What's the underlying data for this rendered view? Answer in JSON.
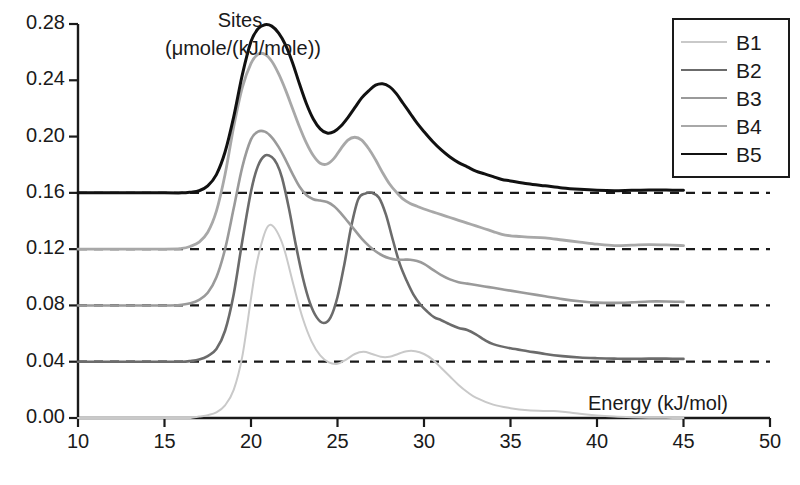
{
  "chart_data": {
    "type": "line",
    "title": "",
    "xlabel": "Energy (kJ/mol)",
    "ylabel": "Sites",
    "ylabel_units": "(μmole/(kJ/mole))",
    "xlim": [
      10,
      50
    ],
    "ylim": [
      0.0,
      0.28
    ],
    "xticks": [
      10,
      15,
      20,
      25,
      30,
      35,
      40,
      45,
      50
    ],
    "xtick_labels": [
      "10",
      "15",
      "20",
      "25",
      "30",
      "35",
      "40",
      "45",
      "50"
    ],
    "yticks": [
      0.0,
      0.04,
      0.08,
      0.12,
      0.16,
      0.2,
      0.24,
      0.28
    ],
    "ytick_labels": [
      "0.00",
      "0.04",
      "0.08",
      "0.12",
      "0.16",
      "0.20",
      "0.24",
      "0.28"
    ],
    "grid": false,
    "baseline_style": "dashed",
    "legend_position": "top-right",
    "note": "Site energy distribution curves, each vertically offset onto its own dashed baseline",
    "series": [
      {
        "name": "B1",
        "color": "#c9c9c9",
        "width": 2.0,
        "baseline": 0.0,
        "x": [
          10,
          15,
          16,
          16.5,
          17,
          17.5,
          18,
          18.5,
          19,
          19.5,
          20,
          20.3,
          20.7,
          21,
          21.3,
          21.7,
          22,
          22.5,
          23,
          23.5,
          24,
          24.5,
          25,
          25.5,
          26,
          26.5,
          27,
          27.5,
          28,
          28.5,
          29,
          29.5,
          30,
          30.5,
          31,
          31.5,
          32,
          32.5,
          33,
          34,
          35,
          36,
          37,
          37.5,
          38,
          39,
          40,
          41,
          42,
          43,
          44,
          45
        ],
        "y": [
          0.0,
          0.0,
          0.0,
          0.0,
          0.001,
          0.002,
          0.004,
          0.009,
          0.02,
          0.044,
          0.085,
          0.108,
          0.128,
          0.1365,
          0.136,
          0.1275,
          0.1165,
          0.0925,
          0.0705,
          0.0545,
          0.0445,
          0.0395,
          0.0385,
          0.0415,
          0.0455,
          0.047,
          0.0455,
          0.0435,
          0.0435,
          0.0455,
          0.0475,
          0.0475,
          0.0455,
          0.0415,
          0.0355,
          0.0295,
          0.0235,
          0.0185,
          0.0145,
          0.0095,
          0.007,
          0.0055,
          0.005,
          0.005,
          0.0045,
          0.003,
          0.0018,
          0.001,
          0.0005,
          0.0002,
          0.0001,
          0.0
        ]
      },
      {
        "name": "B2",
        "color": "#6b6b6b",
        "width": 2.6,
        "baseline": 0.04,
        "x": [
          10,
          15,
          16,
          16.5,
          17,
          17.5,
          18,
          18.5,
          19,
          19.5,
          20,
          20.4,
          20.8,
          21.2,
          21.5,
          21.8,
          22.2,
          22.6,
          23,
          23.4,
          23.8,
          24.2,
          24.6,
          25,
          25.4,
          25.8,
          26.2,
          26.6,
          27,
          27.4,
          27.8,
          28.2,
          28.6,
          29,
          29.4,
          29.8,
          30.2,
          30.6,
          31,
          31.5,
          32,
          32.5,
          33,
          33.5,
          34,
          35,
          36,
          37,
          38,
          39,
          40,
          41,
          42,
          43,
          44,
          45
        ],
        "y": [
          0.0,
          0.0,
          0.0,
          0.0005,
          0.0015,
          0.004,
          0.009,
          0.022,
          0.048,
          0.086,
          0.121,
          0.139,
          0.1465,
          0.1455,
          0.1405,
          0.1305,
          0.1085,
          0.0825,
          0.0595,
          0.042,
          0.0315,
          0.0275,
          0.0315,
          0.046,
          0.0695,
          0.0965,
          0.1155,
          0.1195,
          0.12,
          0.1165,
          0.1045,
          0.0865,
          0.0695,
          0.0575,
          0.0475,
          0.0405,
          0.0355,
          0.0315,
          0.0295,
          0.0265,
          0.024,
          0.0225,
          0.0195,
          0.0155,
          0.0125,
          0.0095,
          0.0075,
          0.0055,
          0.004,
          0.003,
          0.0025,
          0.0022,
          0.002,
          0.0022,
          0.0022,
          0.002
        ]
      },
      {
        "name": "B3",
        "color": "#9a9a9a",
        "width": 2.6,
        "baseline": 0.08,
        "x": [
          10,
          15,
          16,
          16.5,
          17,
          17.5,
          18,
          18.5,
          19,
          19.5,
          20,
          20.4,
          20.8,
          21.2,
          21.6,
          22,
          22.4,
          22.8,
          23.2,
          23.6,
          24,
          24.4,
          24.8,
          25.2,
          25.6,
          26,
          26.4,
          26.8,
          27.2,
          27.6,
          28,
          28.4,
          28.8,
          29.2,
          29.6,
          30,
          30.5,
          31,
          31.5,
          32,
          32.5,
          33,
          33.5,
          34,
          34.5,
          35,
          36,
          37,
          38,
          39,
          40,
          41,
          42,
          43,
          44,
          45
        ],
        "y": [
          0.0,
          0.0,
          0.0005,
          0.0015,
          0.004,
          0.009,
          0.02,
          0.04,
          0.069,
          0.0985,
          0.118,
          0.1235,
          0.1235,
          0.1195,
          0.1125,
          0.1035,
          0.0935,
          0.0845,
          0.0785,
          0.0755,
          0.0745,
          0.0735,
          0.0705,
          0.0655,
          0.0595,
          0.0535,
          0.0475,
          0.0425,
          0.0385,
          0.0355,
          0.0335,
          0.0325,
          0.0325,
          0.0325,
          0.0315,
          0.0295,
          0.0255,
          0.0215,
          0.0185,
          0.0165,
          0.0155,
          0.0145,
          0.0135,
          0.0125,
          0.0115,
          0.0105,
          0.0085,
          0.0065,
          0.0045,
          0.003,
          0.002,
          0.0018,
          0.0022,
          0.0028,
          0.0028,
          0.0025
        ]
      },
      {
        "name": "B4",
        "color": "#a8a8a8",
        "width": 2.8,
        "baseline": 0.12,
        "x": [
          10,
          15,
          16,
          16.5,
          17,
          17.5,
          18,
          18.5,
          19,
          19.5,
          20,
          20.4,
          20.8,
          21.2,
          21.6,
          22,
          22.4,
          22.8,
          23.2,
          23.6,
          24,
          24.4,
          24.8,
          25.2,
          25.6,
          26,
          26.4,
          26.8,
          27.2,
          27.6,
          28,
          28.4,
          28.8,
          29.2,
          29.6,
          30,
          30.5,
          31,
          31.5,
          32,
          32.5,
          33,
          33.5,
          34,
          34.5,
          35,
          35.5,
          36,
          37,
          38,
          39,
          40,
          41,
          42,
          43,
          44,
          45
        ],
        "y": [
          0.0,
          0.0,
          0.0005,
          0.002,
          0.005,
          0.012,
          0.027,
          0.053,
          0.087,
          0.115,
          0.132,
          0.1385,
          0.1385,
          0.1335,
          0.1245,
          0.113,
          0.1,
          0.087,
          0.0755,
          0.0665,
          0.061,
          0.0605,
          0.0645,
          0.0715,
          0.0775,
          0.0795,
          0.0775,
          0.0715,
          0.0635,
          0.0545,
          0.0465,
          0.0405,
          0.0355,
          0.0325,
          0.0305,
          0.0285,
          0.0265,
          0.0245,
          0.0225,
          0.0205,
          0.0185,
          0.0165,
          0.0145,
          0.0125,
          0.0105,
          0.0095,
          0.009,
          0.0085,
          0.008,
          0.0065,
          0.005,
          0.0035,
          0.0025,
          0.0028,
          0.0032,
          0.003,
          0.0025
        ]
      },
      {
        "name": "B5",
        "color": "#111111",
        "width": 3.0,
        "baseline": 0.16,
        "x": [
          10,
          15,
          16,
          16.5,
          17,
          17.5,
          18,
          18.5,
          19,
          19.5,
          20,
          20.4,
          20.8,
          21.2,
          21.6,
          22,
          22.4,
          22.8,
          23.2,
          23.6,
          24,
          24.4,
          24.8,
          25.2,
          25.6,
          26,
          26.4,
          26.8,
          27.2,
          27.6,
          28,
          28.4,
          28.8,
          29.2,
          29.6,
          30,
          30.5,
          31,
          31.5,
          32,
          32.5,
          33,
          33.5,
          34,
          34.5,
          35,
          36,
          37,
          38,
          39,
          40,
          41,
          42,
          43,
          44,
          45
        ],
        "y": [
          0.0,
          0.0,
          0.0,
          0.0005,
          0.0015,
          0.005,
          0.013,
          0.029,
          0.054,
          0.084,
          0.1075,
          0.1165,
          0.1195,
          0.1185,
          0.1135,
          0.105,
          0.0925,
          0.0775,
          0.0635,
          0.0525,
          0.0455,
          0.0425,
          0.0435,
          0.0475,
          0.0535,
          0.0605,
          0.0675,
          0.0725,
          0.0765,
          0.0775,
          0.0755,
          0.0705,
          0.0635,
          0.0565,
          0.0495,
          0.0435,
          0.0365,
          0.0305,
          0.0255,
          0.0215,
          0.0185,
          0.0155,
          0.0135,
          0.0115,
          0.0095,
          0.0085,
          0.0065,
          0.005,
          0.0035,
          0.0025,
          0.0018,
          0.0015,
          0.0018,
          0.002,
          0.002,
          0.0018
        ]
      }
    ]
  },
  "legend": {
    "items": [
      {
        "label": "B1"
      },
      {
        "label": "B2"
      },
      {
        "label": "B3"
      },
      {
        "label": "B4"
      },
      {
        "label": "B5"
      }
    ]
  },
  "axis_titles": {
    "y_line1": "Sites",
    "y_line2": "(μmole/(kJ/mole))",
    "x": "Energy (kJ/mol)"
  }
}
